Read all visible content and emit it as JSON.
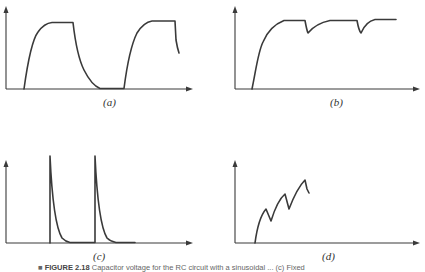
{
  "figure": {
    "panels": [
      {
        "id": "a",
        "label": "(a)",
        "description": "Charge/discharge cycles reaching plateau"
      },
      {
        "id": "b",
        "label": "(b)",
        "description": "Rise to plateau with periodic dips"
      },
      {
        "id": "c",
        "label": "(c)",
        "description": "Sharp spikes with exponential decay"
      },
      {
        "id": "d",
        "label": "(d)",
        "description": "Sawtooth rising staircase"
      }
    ],
    "caption": {
      "marker": "■",
      "number": "FIGURE 2.18",
      "text": "Capacitor voltage for the RC circuit with a sinusoidal ... (c) Fixed"
    }
  }
}
